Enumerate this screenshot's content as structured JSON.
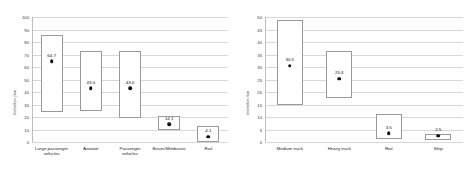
{
  "chart_data": [
    {
      "type": "bar",
      "title": "",
      "subtitle": "",
      "panel": "left",
      "xlabel": "",
      "ylabel": "toe/million pkm",
      "ylim": [
        0,
        100
      ],
      "yticks": [
        0,
        10,
        20,
        30,
        40,
        50,
        60,
        70,
        80,
        90,
        100
      ],
      "ytick_labels": [
        "0",
        "10",
        "20",
        "30",
        "40",
        "50",
        "60",
        "70",
        "80",
        "90",
        "100"
      ],
      "grid": true,
      "legend": "none",
      "categories": [
        "Large passenger\nvehicles",
        "Aviation",
        "Passenger\nvehicles",
        "Buses/Minibuses",
        "Rail"
      ],
      "values": [
        64.7,
        43.0,
        43.0,
        14.1,
        4.1
      ],
      "value_labels": [
        "64.7",
        "43.0",
        "43.0",
        "14.1",
        "4.1"
      ],
      "range_low": [
        24.0,
        24.5,
        19.0,
        10.0,
        0.0
      ],
      "range_high": [
        85.5,
        72.5,
        72.5,
        20.5,
        13.0
      ]
    },
    {
      "type": "bar",
      "title": "",
      "subtitle": "",
      "panel": "right",
      "xlabel": "",
      "ylabel": "toe/million tkm",
      "ylim": [
        0,
        50
      ],
      "yticks": [
        0,
        5,
        10,
        15,
        20,
        25,
        30,
        35,
        40,
        45,
        50
      ],
      "ytick_labels": [
        "0",
        "5",
        "10",
        "15",
        "20",
        "25",
        "30",
        "35",
        "40",
        "45",
        "50"
      ],
      "grid": true,
      "legend": "none",
      "categories": [
        "Medium truck",
        "Heavy truck",
        "Rail",
        "Ship"
      ],
      "values": [
        30.5,
        25.4,
        3.5,
        2.5
      ],
      "value_labels": [
        "30.5",
        "25.4",
        "3.5",
        "2.5"
      ],
      "range_low": [
        15.0,
        17.8,
        1.2,
        0.9
      ],
      "range_high": [
        48.7,
        36.4,
        11.4,
        3.2
      ]
    }
  ]
}
